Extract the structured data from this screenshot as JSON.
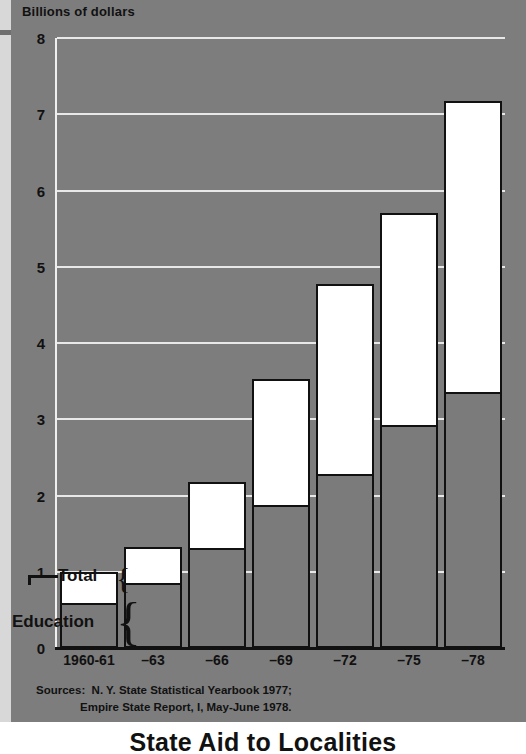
{
  "axis_title": "Billions of dollars",
  "bottom_title": "State Aid to Localities",
  "legend": {
    "total_label": "Total",
    "education_label": "Education",
    "brace_glyph": "{"
  },
  "sources": {
    "line1": "Sources:  N. Y. State Statistical Yearbook 1977;",
    "line2": "Empire State Report, I, May-June 1978."
  },
  "chart_data": {
    "type": "bar",
    "title": "State Aid to Localities",
    "subtitle": "",
    "xlabel": "",
    "ylabel": "Billions of dollars",
    "ylim": [
      0,
      8
    ],
    "yticks": [
      "0",
      "1",
      "2",
      "3",
      "4",
      "5",
      "6",
      "7",
      "8"
    ],
    "grid": true,
    "legend_position": "inline-left",
    "stacked": true,
    "categories": [
      "1960-61",
      "–63",
      "–66",
      "–69",
      "–72",
      "–75",
      "–78"
    ],
    "series": [
      {
        "name": "Education",
        "color": "#7b7b7b",
        "values": [
          0.57,
          0.83,
          1.28,
          1.85,
          2.25,
          2.9,
          3.33
        ]
      },
      {
        "name": "Total",
        "color": "#ffffff",
        "values": [
          1.0,
          1.33,
          2.18,
          3.53,
          4.78,
          5.7,
          7.17
        ]
      }
    ],
    "annotations": [
      "Total brace marks the white upper segment of the first bar",
      "Education brace marks the gray lower segment of the first bar"
    ]
  },
  "colors": {
    "background": "#7d7d7d",
    "education_fill": "#7b7b7b",
    "total_fill": "#ffffff",
    "gridline": "#e8e8e8",
    "outline": "#111111",
    "left_stripe": "#d8d8d8"
  }
}
